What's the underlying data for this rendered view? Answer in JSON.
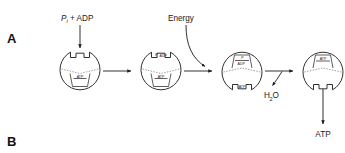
{
  "figure": {
    "panels": [
      {
        "id": "panel-a",
        "label": "A"
      },
      {
        "id": "panel-b",
        "label": "B"
      }
    ],
    "inputs": {
      "substrate_p": "P",
      "substrate_p_sub": "i",
      "substrate_rest": "+ ADP",
      "energy_label": "Energy"
    },
    "outputs": {
      "water_h": "H",
      "water_sub": "2",
      "water_rest": "O",
      "product_label": "ATP"
    },
    "steps": [
      {
        "id": "enzyme-state-1",
        "top_site_label": "",
        "bottom_site_label": "ATP",
        "top_site_open": true,
        "bottom_site_open": false
      },
      {
        "id": "enzyme-state-2",
        "top_site_label": "P  ADP",
        "top_site_label_p": "P",
        "top_site_label_sub": "i",
        "top_site_label_rest": "ADP",
        "bottom_site_label": "ATP",
        "top_site_open": false,
        "bottom_site_open": false
      },
      {
        "id": "enzyme-state-3",
        "top_site_label_p": "P",
        "top_site_label_sub": "i",
        "top_site_label_rest": "ADP",
        "bottom_site_label": "ATP",
        "top_site_open": false,
        "bottom_site_open": false
      },
      {
        "id": "enzyme-state-4",
        "top_site_label": "ATP",
        "bottom_site_label": "",
        "top_site_open": false,
        "bottom_site_open": true
      }
    ],
    "colors": {
      "ink": "#1a1a1a",
      "background": "#ffffff",
      "dotted": "#555555"
    }
  }
}
